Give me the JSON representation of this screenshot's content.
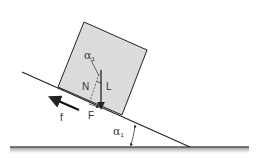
{
  "diagram": {
    "labels": {
      "angle_top": "α",
      "angle_top_sub": "1",
      "normal": "N",
      "lift": "L",
      "force": "F",
      "friction": "f",
      "angle_bottom": "α",
      "angle_bottom_sub": "1"
    },
    "colors": {
      "block_fill": "#dcdcdc",
      "stroke": "#222222",
      "ground": "#555555",
      "background": "#ffffff"
    }
  }
}
